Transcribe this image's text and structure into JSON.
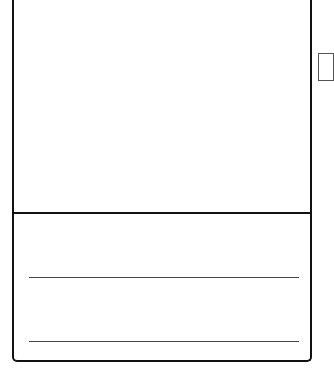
{
  "card": {
    "media": {
      "label": ""
    },
    "footer": {
      "lines": [
        {
          "text": ""
        },
        {
          "text": ""
        }
      ]
    }
  },
  "side_box": {
    "label": ""
  },
  "colors": {
    "border": "#111111",
    "line": "#444444",
    "background": "#ffffff"
  }
}
